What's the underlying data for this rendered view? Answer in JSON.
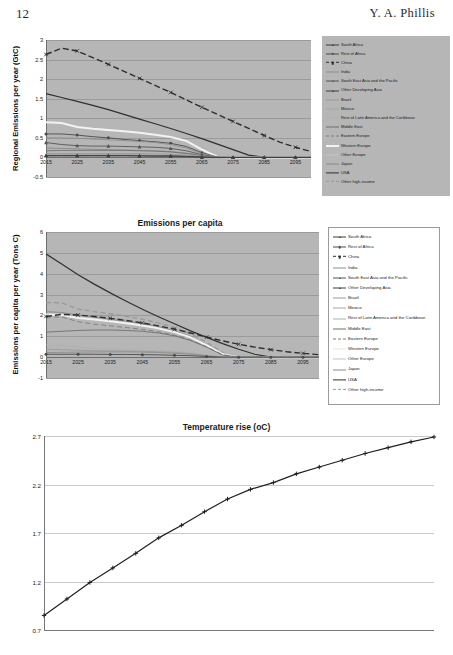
{
  "page": {
    "folio": "12",
    "running_head": "Y. A. Phillis"
  },
  "palette": {
    "plot_background_gray": "#b6b6b6",
    "plot_background_white": "#ffffff",
    "gridline_gray": "#9a9a9a",
    "gridline_white": "#c9c9c9",
    "axis": "#6e6e6e",
    "text": "#1a1a1a"
  },
  "series_names": [
    "South Africa",
    "Rest of Africa",
    "China",
    "India",
    "South East Asia and the Pacific",
    "Other Developing Asia",
    "Brazil",
    "Mexico",
    "Rest of Latin America and the Caribbean",
    "Middle East",
    "Eastern Europe",
    "Western Europe",
    "Other Europe",
    "Japan",
    "USA",
    "Other high-income"
  ],
  "series_colors": [
    "#3a3a3a",
    "#4a4a4a",
    "#2e2e2e",
    "#8d8d8d",
    "#555555",
    "#3f3f3f",
    "#9a9a9a",
    "#a5a5a5",
    "#b0b0b0",
    "#707070",
    "#7c7c7c",
    "#f2f2f2",
    "#c4c4c4",
    "#8a8a8a",
    "#303030",
    "#999999"
  ],
  "chart_data": [
    {
      "id": "regional-emissions",
      "type": "line",
      "title": "",
      "xlabel": "",
      "ylabel": "Regional  Emissions  per  year  (GtC)",
      "x": [
        2015,
        2020,
        2025,
        2030,
        2035,
        2040,
        2045,
        2050,
        2055,
        2060,
        2065,
        2070,
        2075,
        2080,
        2085,
        2090,
        2095,
        2100
      ],
      "xlim": [
        2015,
        2100
      ],
      "ylim": [
        -0.5,
        3
      ],
      "yticks": [
        "3",
        "2.5",
        "2",
        "1.5",
        "1",
        "0.5",
        "0",
        "-0.5"
      ],
      "ytick_values": [
        3,
        2.5,
        2,
        1.5,
        1,
        0.5,
        0,
        -0.5
      ],
      "xticks": [
        "2015",
        "2025",
        "2035",
        "2045",
        "2055",
        "2065",
        "2075",
        "2085",
        "2095"
      ],
      "xtick_values": [
        2015,
        2025,
        2035,
        2045,
        2055,
        2065,
        2075,
        2085,
        2095
      ],
      "grid": true,
      "legend_position": "right",
      "series": [
        {
          "name": "China",
          "values": [
            2.63,
            2.79,
            2.72,
            2.55,
            2.38,
            2.2,
            2.02,
            1.84,
            1.66,
            1.47,
            1.28,
            1.1,
            0.92,
            0.74,
            0.56,
            0.39,
            0.26,
            0.15
          ]
        },
        {
          "name": "USA",
          "values": [
            1.63,
            1.53,
            1.43,
            1.33,
            1.22,
            1.1,
            0.98,
            0.86,
            0.74,
            0.61,
            0.48,
            0.34,
            0.2,
            0.06,
            0.0,
            0.0,
            0.0,
            0.0
          ]
        },
        {
          "name": "Western Europe",
          "values": [
            0.9,
            0.88,
            0.78,
            0.73,
            0.7,
            0.67,
            0.63,
            0.58,
            0.52,
            0.42,
            0.2,
            0.02,
            0.0,
            0.0,
            0.0,
            0.0,
            0.0,
            0.0
          ]
        },
        {
          "name": "Rest of Africa",
          "values": [
            0.6,
            0.6,
            0.57,
            0.53,
            0.5,
            0.46,
            0.43,
            0.4,
            0.36,
            0.28,
            0.12,
            0.01,
            0.0,
            0.0,
            0.0,
            0.0,
            0.0,
            0.0
          ]
        },
        {
          "name": "India",
          "values": [
            0.5,
            0.5,
            0.49,
            0.47,
            0.45,
            0.43,
            0.41,
            0.38,
            0.33,
            0.24,
            0.1,
            0.01,
            0.0,
            0.0,
            0.0,
            0.0,
            0.0,
            0.0
          ]
        },
        {
          "name": "South East Asia and the Pacific",
          "values": [
            0.38,
            0.33,
            0.3,
            0.29,
            0.29,
            0.28,
            0.27,
            0.26,
            0.23,
            0.17,
            0.07,
            0.0,
            0.0,
            0.0,
            0.0,
            0.0,
            0.0,
            0.0
          ]
        },
        {
          "name": "Japan",
          "values": [
            0.24,
            0.23,
            0.22,
            0.21,
            0.2,
            0.19,
            0.18,
            0.17,
            0.15,
            0.11,
            0.05,
            0.0,
            0.0,
            0.0,
            0.0,
            0.0,
            0.0,
            0.0
          ]
        },
        {
          "name": "Middle East",
          "values": [
            0.17,
            0.18,
            0.18,
            0.18,
            0.18,
            0.18,
            0.17,
            0.16,
            0.14,
            0.1,
            0.04,
            0.0,
            0.0,
            0.0,
            0.0,
            0.0,
            0.0,
            0.0
          ]
        },
        {
          "name": "Brazil",
          "values": [
            0.1,
            0.1,
            0.1,
            0.1,
            0.1,
            0.1,
            0.1,
            0.09,
            0.08,
            0.06,
            0.03,
            0.0,
            0.0,
            0.0,
            0.0,
            0.0,
            0.0,
            0.0
          ]
        },
        {
          "name": "Mexico",
          "values": [
            0.07,
            0.07,
            0.07,
            0.07,
            0.07,
            0.07,
            0.07,
            0.06,
            0.05,
            0.04,
            0.02,
            0.0,
            0.0,
            0.0,
            0.0,
            0.0,
            0.0,
            0.0
          ]
        },
        {
          "name": "South Africa",
          "values": [
            0.05,
            0.05,
            0.05,
            0.05,
            0.05,
            0.05,
            0.04,
            0.04,
            0.04,
            0.03,
            0.01,
            0.0,
            0.0,
            0.0,
            0.0,
            0.0,
            0.0,
            0.0
          ]
        },
        {
          "name": "Other Developing Asia",
          "values": [
            0.04,
            0.04,
            0.04,
            0.04,
            0.04,
            0.04,
            0.04,
            0.03,
            0.03,
            0.02,
            0.01,
            0.0,
            0.0,
            0.0,
            0.0,
            0.0,
            0.0,
            0.0
          ]
        }
      ]
    },
    {
      "id": "emissions-per-capita",
      "type": "line",
      "title": "Emissions per capita",
      "xlabel": "",
      "ylabel": "Emissions per capita  per year  (Tons C)",
      "x": [
        2015,
        2020,
        2025,
        2030,
        2035,
        2040,
        2045,
        2050,
        2055,
        2060,
        2065,
        2070,
        2075,
        2080,
        2085,
        2090,
        2095,
        2100
      ],
      "xlim": [
        2015,
        2100
      ],
      "ylim": [
        -1,
        6
      ],
      "yticks": [
        "6",
        "5",
        "4",
        "3",
        "2",
        "1",
        "0",
        "-1"
      ],
      "ytick_values": [
        6,
        5,
        4,
        3,
        2,
        1,
        0,
        -1
      ],
      "xticks": [
        "2015",
        "2025",
        "2035",
        "2045",
        "2055",
        "2065",
        "2075",
        "2085",
        "2095"
      ],
      "xtick_values": [
        2015,
        2025,
        2035,
        2045,
        2055,
        2065,
        2075,
        2085,
        2095
      ],
      "grid": true,
      "legend_position": "right",
      "series": [
        {
          "name": "USA",
          "values": [
            4.95,
            4.45,
            3.95,
            3.5,
            3.08,
            2.68,
            2.3,
            1.94,
            1.6,
            1.26,
            0.95,
            0.65,
            0.38,
            0.14,
            0.0,
            0.0,
            0.0,
            0.0
          ]
        },
        {
          "name": "Other high-income",
          "values": [
            2.62,
            2.6,
            2.3,
            2.18,
            2.08,
            1.96,
            1.82,
            1.64,
            1.42,
            1.12,
            0.72,
            0.22,
            0.0,
            0.0,
            0.0,
            0.0,
            0.0,
            0.0
          ]
        },
        {
          "name": "Japan",
          "values": [
            2.18,
            2.14,
            2.02,
            1.92,
            1.82,
            1.72,
            1.6,
            1.46,
            1.26,
            1.0,
            0.62,
            0.18,
            0.0,
            0.0,
            0.0,
            0.0,
            0.0,
            0.0
          ]
        },
        {
          "name": "Western Europe",
          "values": [
            2.05,
            2.02,
            1.88,
            1.8,
            1.72,
            1.63,
            1.52,
            1.38,
            1.2,
            0.95,
            0.58,
            0.15,
            0.0,
            0.0,
            0.0,
            0.0,
            0.0,
            0.0
          ]
        },
        {
          "name": "Eastern Europe",
          "values": [
            1.92,
            1.92,
            1.7,
            1.58,
            1.5,
            1.42,
            1.33,
            1.22,
            1.05,
            0.82,
            0.5,
            0.12,
            0.0,
            0.0,
            0.0,
            0.0,
            0.0,
            0.0
          ]
        },
        {
          "name": "Middle East",
          "values": [
            1.2,
            1.24,
            1.28,
            1.3,
            1.3,
            1.28,
            1.24,
            1.16,
            1.02,
            0.8,
            0.48,
            0.1,
            0.0,
            0.0,
            0.0,
            0.0,
            0.0,
            0.0
          ]
        },
        {
          "name": "China",
          "values": [
            1.95,
            2.05,
            2.02,
            1.95,
            1.86,
            1.76,
            1.64,
            1.5,
            1.34,
            1.16,
            0.96,
            0.78,
            0.62,
            0.48,
            0.36,
            0.26,
            0.18,
            0.12
          ]
        },
        {
          "name": "Rest of Latin America and the Caribbean",
          "values": [
            0.58,
            0.55,
            0.48,
            0.42,
            0.38,
            0.36,
            0.34,
            0.32,
            0.28,
            0.22,
            0.1,
            0.0,
            0.0,
            0.0,
            0.0,
            0.0,
            0.0,
            0.0
          ]
        },
        {
          "name": "Brazil",
          "values": [
            0.38,
            0.36,
            0.33,
            0.31,
            0.3,
            0.29,
            0.28,
            0.26,
            0.23,
            0.17,
            0.07,
            0.0,
            0.0,
            0.0,
            0.0,
            0.0,
            0.0,
            0.0
          ]
        },
        {
          "name": "India",
          "values": [
            0.22,
            0.23,
            0.24,
            0.25,
            0.25,
            0.25,
            0.24,
            0.22,
            0.19,
            0.14,
            0.06,
            0.0,
            0.0,
            0.0,
            0.0,
            0.0,
            0.0,
            0.0
          ]
        },
        {
          "name": "Rest of Africa",
          "values": [
            0.14,
            0.14,
            0.14,
            0.14,
            0.13,
            0.13,
            0.12,
            0.11,
            0.09,
            0.07,
            0.03,
            0.0,
            0.0,
            0.0,
            0.0,
            0.0,
            0.0,
            0.0
          ]
        }
      ]
    },
    {
      "id": "temperature-rise",
      "type": "line",
      "title": "Temperature rise (oC)",
      "xlabel": "",
      "ylabel": "",
      "x": [
        2015,
        2020,
        2025,
        2030,
        2035,
        2040,
        2045,
        2050,
        2055,
        2060,
        2065,
        2070,
        2075,
        2080,
        2085,
        2090,
        2095,
        2100
      ],
      "xlim": [
        2015,
        2100
      ],
      "ylim": [
        0.7,
        2.7
      ],
      "yticks": [
        "2.7",
        "2.2",
        "1.7",
        "1.2",
        "0.7"
      ],
      "ytick_values": [
        2.7,
        2.2,
        1.7,
        1.2,
        0.7
      ],
      "xticks": [
        "2015",
        "2025",
        "2035",
        "2045",
        "2055",
        "2065",
        "2075",
        "2085",
        "2095"
      ],
      "xtick_values": [
        2015,
        2025,
        2035,
        2045,
        2055,
        2065,
        2075,
        2085,
        2095
      ],
      "grid": true,
      "legend_position": "none",
      "line_color": "#1f1f1f",
      "marker": "plus",
      "values": [
        0.85,
        1.02,
        1.19,
        1.34,
        1.49,
        1.65,
        1.78,
        1.92,
        2.05,
        2.15,
        2.22,
        2.31,
        2.38,
        2.45,
        2.52,
        2.58,
        2.64,
        2.69
      ]
    }
  ]
}
